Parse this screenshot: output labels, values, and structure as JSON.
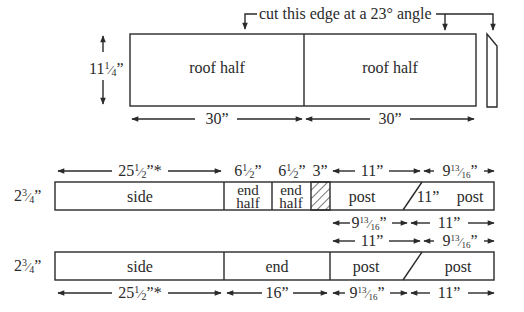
{
  "annotation": {
    "cut_note": "cut this edge at a 23° angle"
  },
  "roof_board": {
    "height_label": "11",
    "height_frac_num": "1",
    "height_frac_den": "4",
    "height_unit": "”",
    "pieces": [
      {
        "label": "roof half",
        "width_label": "30”"
      },
      {
        "label": "roof half",
        "width_label": "30”"
      }
    ]
  },
  "board_1": {
    "height_whole": "2",
    "height_frac_num": "3",
    "height_frac_den": "4",
    "height_unit": "”",
    "pieces": [
      {
        "label": "side"
      },
      {
        "label_line1": "end",
        "label_line2": "half"
      },
      {
        "label_line1": "end",
        "label_line2": "half"
      },
      {
        "label": "",
        "hatched": true
      },
      {
        "label": "post"
      },
      {
        "label": "11”"
      },
      {
        "label": "post"
      }
    ],
    "top_dims": [
      {
        "whole": "25",
        "num": "1",
        "den": "2",
        "suffix": "”*"
      },
      {
        "whole": "6",
        "num": "1",
        "den": "2",
        "suffix": "”"
      },
      {
        "whole": "6",
        "num": "1",
        "den": "2",
        "suffix": "”"
      },
      {
        "text": "3”"
      },
      {
        "text": "11”"
      },
      {
        "whole": "9",
        "num": "13",
        "den": "16",
        "suffix": "”"
      }
    ],
    "bottom_dims": [
      {
        "whole": "9",
        "num": "13",
        "den": "16",
        "suffix": "”"
      },
      {
        "text": "11”"
      }
    ]
  },
  "board_2": {
    "height_whole": "2",
    "height_frac_num": "3",
    "height_frac_den": "4",
    "height_unit": "”",
    "pieces": [
      {
        "label": "side"
      },
      {
        "label": "end"
      },
      {
        "label": "post"
      },
      {
        "label": "post"
      }
    ],
    "top_dims": [
      {
        "text": "11”"
      },
      {
        "whole": "9",
        "num": "13",
        "den": "16",
        "suffix": "”"
      }
    ],
    "bottom_dims": [
      {
        "whole": "25",
        "num": "1",
        "den": "2",
        "suffix": "”*"
      },
      {
        "text": "16”"
      },
      {
        "whole": "9",
        "num": "13",
        "den": "16",
        "suffix": "”"
      },
      {
        "text": "11”"
      }
    ]
  },
  "colors": {
    "line": "#2a2a2a",
    "background": "#ffffff"
  }
}
